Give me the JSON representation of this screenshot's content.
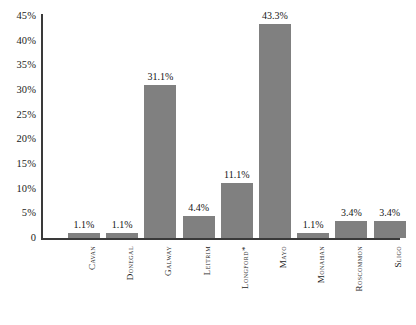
{
  "chart_data": {
    "type": "bar",
    "title": "",
    "subtitle": "",
    "xlabel": "",
    "ylabel": "",
    "categories": [
      "Cavan",
      "Donegal",
      "Galway",
      "Leitrim",
      "Longford*",
      "Mayo",
      "Monahan",
      "Roscommon",
      "Sligo"
    ],
    "values": [
      1.1,
      1.1,
      31.1,
      4.4,
      11.1,
      43.3,
      1.1,
      3.4,
      3.4
    ],
    "value_labels": [
      "1.1%",
      "1.1%",
      "31.1%",
      "4.4%",
      "11.1%",
      "43.3%",
      "1.1%",
      "3.4%",
      "3.4%"
    ],
    "ylim": [
      0,
      45
    ],
    "ytick_values": [
      0,
      5,
      10,
      15,
      20,
      25,
      30,
      35,
      40,
      45
    ],
    "ytick_labels": [
      "0",
      "5%",
      "10%",
      "15%",
      "20%",
      "25%",
      "30%",
      "35%",
      "40%",
      "45%"
    ],
    "grid": false,
    "legend": false,
    "legend_position": "none",
    "series": [
      {
        "name": "",
        "values": [
          1.1,
          1.1,
          31.1,
          4.4,
          11.1,
          43.3,
          1.1,
          3.4,
          3.4
        ]
      }
    ],
    "colors": {
      "bar": "#808080",
      "axis": "#3a3a3a",
      "text": "#1b1b1b",
      "background": "#ffffff"
    }
  }
}
